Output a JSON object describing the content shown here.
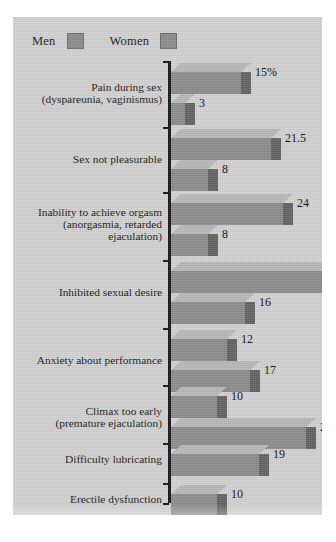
{
  "legend": {
    "items": [
      {
        "label": "Men",
        "color": "#8d8d8d"
      },
      {
        "label": "Women",
        "color": "#8d8d8d"
      }
    ]
  },
  "chart_data": {
    "type": "bar",
    "orientation": "horizontal",
    "style": "3d",
    "title": "",
    "xlabel": "",
    "ylabel": "",
    "grid": false,
    "legend_position": "top-left",
    "xlim": [
      0,
      34
    ],
    "unit_note": "15%",
    "categories": [
      "Pain during sex (dyspareunia, vaginismus)",
      "Sex not pleasurable",
      "Inability to achieve orgasm (anorgasmia, retarded ejaculation)",
      "Inhibited sexual desire",
      "Anxiety about performance",
      "Climax too early (premature ejaculation)",
      "Difficulty lubricating",
      "Erectile dysfunction"
    ],
    "series": [
      {
        "name": "Men",
        "values": [
          null,
          null,
          null,
          null,
          12,
          10,
          null,
          10
        ]
      },
      {
        "name": "Women",
        "values": [
          15,
          21.5,
          24,
          34,
          17,
          29,
          19,
          null
        ]
      }
    ]
  },
  "groups": [
    {
      "label_lines": [
        "Pain during sex",
        "(dyspareunia, vaginismus)"
      ],
      "bars": [
        {
          "series": "Women",
          "value": 15,
          "display": "15%"
        },
        {
          "series": "Men",
          "value": 3,
          "display": "3"
        }
      ]
    },
    {
      "label_lines": [
        "Sex not pleasurable"
      ],
      "bars": [
        {
          "series": "Women",
          "value": 21.5,
          "display": "21.5"
        },
        {
          "series": "Men",
          "value": 8,
          "display": "8"
        }
      ]
    },
    {
      "label_lines": [
        "Inability to achieve orgasm",
        "(anorgasmia, retarded",
        "ejaculation)"
      ],
      "bars": [
        {
          "series": "Women",
          "value": 24,
          "display": "24"
        },
        {
          "series": "Men",
          "value": 8,
          "display": "8"
        }
      ]
    },
    {
      "label_lines": [
        "Inhibited sexual desire"
      ],
      "bars": [
        {
          "series": "Women",
          "value": 34,
          "display": "34"
        },
        {
          "series": "Men",
          "value": 16,
          "display": "16"
        }
      ]
    },
    {
      "label_lines": [
        "Anxiety about performance"
      ],
      "bars": [
        {
          "series": "Men",
          "value": 12,
          "display": "12"
        },
        {
          "series": "Women",
          "value": 17,
          "display": "17"
        }
      ]
    },
    {
      "label_lines": [
        "Climax too early",
        "(premature ejaculation)"
      ],
      "bars": [
        {
          "series": "Men",
          "value": 10,
          "display": "10"
        },
        {
          "series": "Women",
          "value": 29,
          "display": "29"
        }
      ]
    },
    {
      "label_lines": [
        "Difficulty lubricating"
      ],
      "bars": [
        {
          "series": "Women",
          "value": 19,
          "display": "19"
        }
      ]
    },
    {
      "label_lines": [
        "Erectile dysfunction"
      ],
      "bars": [
        {
          "series": "Men",
          "value": 10,
          "display": "10"
        }
      ]
    }
  ],
  "colors": {
    "panel_background": "#d2d2d2",
    "bar_front": "#8d8d8d",
    "bar_top": "#b9b9b9",
    "bar_side": "#646464",
    "axis": "#181818",
    "text": "#1b1b1b"
  }
}
